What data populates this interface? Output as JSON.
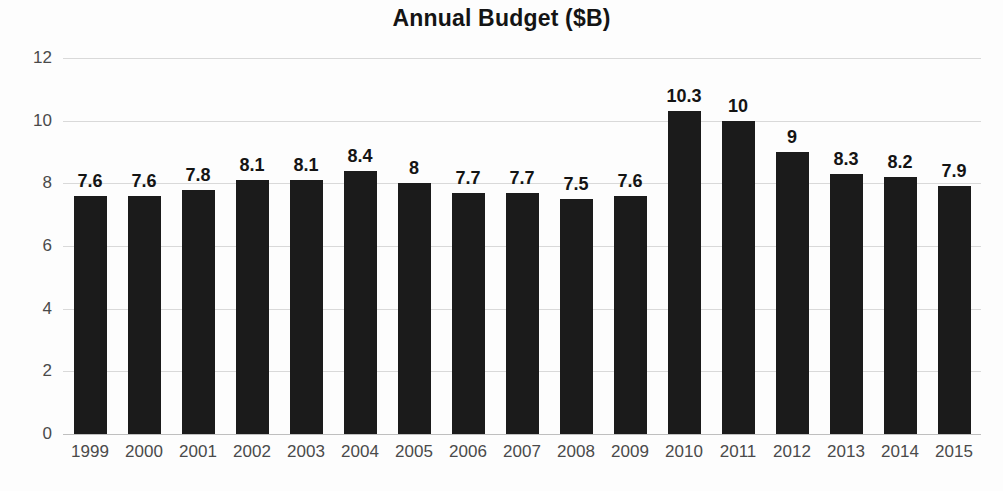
{
  "chart_data": {
    "type": "bar",
    "title": "Annual Budget ($B)",
    "xlabel": "",
    "ylabel": "",
    "categories": [
      "1999",
      "2000",
      "2001",
      "2002",
      "2003",
      "2004",
      "2005",
      "2006",
      "2007",
      "2008",
      "2009",
      "2010",
      "2011",
      "2012",
      "2013",
      "2014",
      "2015"
    ],
    "values": [
      7.6,
      7.6,
      7.8,
      8.1,
      8.1,
      8.4,
      8,
      7.7,
      7.7,
      7.5,
      7.6,
      10.3,
      10,
      9,
      8.3,
      8.2,
      7.9
    ],
    "data_labels": [
      "7.6",
      "7.6",
      "7.8",
      "8.1",
      "8.1",
      "8.4",
      "8",
      "7.7",
      "7.7",
      "7.5",
      "7.6",
      "10.3",
      "10",
      "9",
      "8.3",
      "8.2",
      "7.9"
    ],
    "ylim": [
      0,
      12
    ],
    "y_ticks": [
      0,
      2,
      4,
      6,
      8,
      10,
      12
    ],
    "y_tick_labels": [
      "0",
      "2",
      "4",
      "6",
      "8",
      "10",
      "12"
    ],
    "grid": true,
    "legend": false,
    "legend_position": "none",
    "bar_color": "#1b1b1b",
    "grid_color": "#d9d9d9",
    "axis_color": "#bfbfbf",
    "background_color": "#fdfdfd",
    "text_color": "#141414",
    "tick_text_color": "#4a4a4a"
  }
}
